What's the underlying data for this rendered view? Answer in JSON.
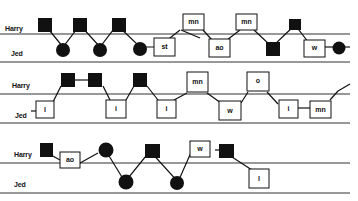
{
  "colors": {
    "ink": "#111111",
    "paper": "#ffffff",
    "rule": "#333333"
  },
  "lanes": {
    "top": "Harry",
    "bottom": "Jed"
  },
  "panels": [
    {
      "id": "panel-1",
      "labels": {
        "harry": "Harry",
        "jed": "Jed"
      },
      "boxes": [
        "st",
        "mn",
        "ao",
        "mn",
        "w"
      ],
      "sequence": [
        "H:square",
        "J:circle",
        "H:square",
        "J:circle",
        "H:square",
        "J:circle",
        "J:box st",
        "H:box mn",
        "J:box ao",
        "H:box mn",
        "J:square",
        "H:square",
        "J:box w",
        "J:circle"
      ]
    },
    {
      "id": "panel-2",
      "labels": {
        "harry": "Harry",
        "jed": "Jed"
      },
      "boxes": [
        "l",
        "i",
        "i",
        "mn",
        "w",
        "o",
        "i",
        "mn"
      ],
      "sequence": [
        "J:box l",
        "H:square",
        "H:square",
        "J:box i",
        "H:square",
        "J:box i",
        "H:box mn",
        "J:box w",
        "H:box o",
        "J:box i",
        "J:box mn",
        "H:continues"
      ]
    },
    {
      "id": "panel-3",
      "labels": {
        "harry": "Harry",
        "jed": "Jed"
      },
      "boxes": [
        "ao",
        "w",
        "l"
      ],
      "sequence": [
        "H:square",
        "H:box ao",
        "H:circle",
        "J:circle",
        "H:square",
        "J:circle",
        "H:box w",
        "H:square",
        "J:box l"
      ]
    }
  ]
}
